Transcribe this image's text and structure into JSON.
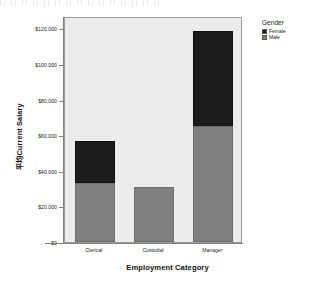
{
  "chart_data": {
    "type": "bar",
    "subtype": "stacked",
    "title": "",
    "xlabel": "Employment Category",
    "ylabel": "平均Current Salary",
    "categories": [
      "Clerical",
      "Custodial",
      "Manager"
    ],
    "series": [
      {
        "name": "Male",
        "color": "#808080",
        "values": [
          33200,
          31000,
          65300
        ]
      },
      {
        "name": "Female",
        "color": "#1c1c1c",
        "values": [
          23400,
          0,
          53000
        ]
      }
    ],
    "totals": [
      56600,
      31000,
      118300
    ],
    "ylim": [
      0,
      127000
    ],
    "yticks": [
      0,
      20000,
      40000,
      60000,
      80000,
      100000,
      120000
    ],
    "ytick_labels": [
      "$0",
      "$20,000",
      "$40,000",
      "$60,000",
      "$80,000",
      "$100,000",
      "$120,000"
    ],
    "grid": false,
    "legend_position": "top-right",
    "plot_background": "#ececec",
    "axis_color": "#808080"
  },
  "legend": {
    "title": "Gender",
    "entries": [
      {
        "label": "Female",
        "color": "#1c1c1c"
      },
      {
        "label": "Male",
        "color": "#808080"
      }
    ]
  },
  "axes": {
    "x_title": "Employment Category",
    "y_title": "平均Current Salary"
  }
}
